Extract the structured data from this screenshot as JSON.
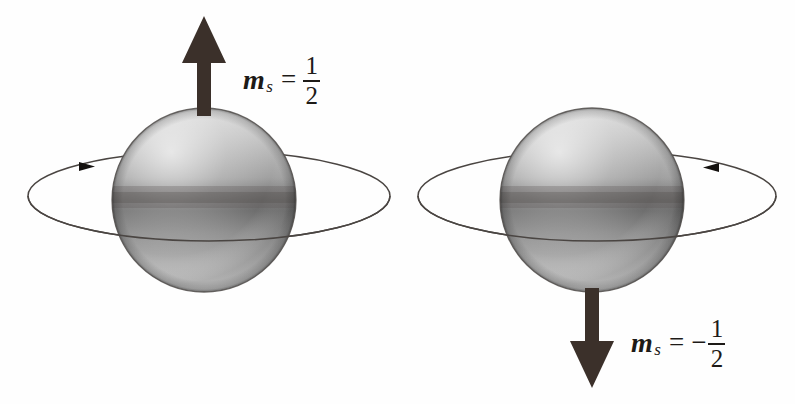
{
  "figure": {
    "background_color": "#fefefe",
    "width": 795,
    "height": 404
  },
  "palette": {
    "arrow_color": "#3b302a",
    "orbit_color": "#4a4542",
    "sphere_light": "#e9e9e9",
    "sphere_mid": "#9a9a9a",
    "sphere_dark": "#5c5c5c",
    "equator_color": "#4a4542",
    "text_color": "#1d1a17"
  },
  "spheres": [
    {
      "id": "spin-up",
      "name": "spin-up-sphere",
      "cx": 204,
      "cy": 200,
      "r": 92,
      "spin_arrow": {
        "direction": "up",
        "tip_y": 16,
        "tail_y": 112,
        "shaft_width": 14,
        "head_width": 44,
        "head_height": 47
      },
      "orbit": {
        "cx": 209,
        "cy": 196,
        "rx": 181,
        "ry": 45,
        "arrow_direction": "right",
        "arrow_x": 93,
        "arrow_y": 166
      },
      "label": {
        "symbol": "m",
        "subscript": "s",
        "equals": "=",
        "sign": "",
        "numerator": "1",
        "denominator": "2",
        "text": "m_s = 1/2"
      }
    },
    {
      "id": "spin-down",
      "name": "spin-down-sphere",
      "cx": 592,
      "cy": 200,
      "r": 92,
      "spin_arrow": {
        "direction": "down",
        "tip_y": 388,
        "tail_y": 292,
        "shaft_width": 14,
        "head_width": 44,
        "head_height": 47
      },
      "orbit": {
        "cx": 597,
        "cy": 196,
        "rx": 179,
        "ry": 45,
        "arrow_direction": "left",
        "arrow_x": 705,
        "arrow_y": 167
      },
      "label": {
        "symbol": "m",
        "subscript": "s",
        "equals": "=",
        "sign": "−",
        "numerator": "1",
        "denominator": "2",
        "text": "m_s = -1/2"
      }
    }
  ]
}
